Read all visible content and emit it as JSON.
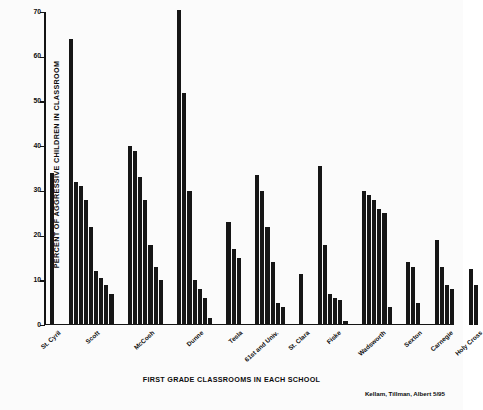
{
  "chart_data": {
    "type": "bar",
    "title": "",
    "xlabel": "FIRST GRADE CLASSROOMS IN EACH SCHOOL",
    "ylabel": "PERCENT OF AGGRESSIVE CHILDREN IN CLASSROOM",
    "ylim": [
      0,
      70
    ],
    "ytick_labels": [
      "0",
      "10",
      "20",
      "30",
      "40",
      "50",
      "60",
      "70"
    ],
    "ytick_values": [
      0,
      10,
      20,
      30,
      40,
      50,
      60,
      70
    ],
    "grid": false,
    "legend": "none",
    "bar_color": "#161616",
    "axis_color": "#141414",
    "credit": "Kellam, Tillman, Albert 5/95",
    "categories": [
      "St. Cyril",
      "Scott",
      "McCosh",
      "Dunne",
      "Tesla",
      "61st and Univ.",
      "St. Clara",
      "Fiske",
      "Wadsworth",
      "Sexton",
      "Carnegie",
      "Holy Cross"
    ],
    "groups": [
      {
        "name": "St. Cyril",
        "values": [
          34
        ]
      },
      {
        "name": "Scott",
        "values": [
          64,
          32,
          31,
          28,
          22,
          12,
          10.5,
          9,
          7
        ]
      },
      {
        "name": "McCosh",
        "values": [
          40,
          39,
          33,
          28,
          18,
          13,
          10
        ]
      },
      {
        "name": "Dunne",
        "values": [
          70.5,
          52,
          30,
          10,
          8,
          6,
          1.5
        ]
      },
      {
        "name": "Tesla",
        "values": [
          23,
          17,
          15
        ]
      },
      {
        "name": "61st and Univ.",
        "values": [
          33.5,
          30,
          22,
          14,
          5,
          4
        ]
      },
      {
        "name": "St. Clara",
        "values": [
          11.5
        ]
      },
      {
        "name": "Fiske",
        "values": [
          35.5,
          18,
          7,
          6,
          5.5,
          1
        ]
      },
      {
        "name": "Wadsworth",
        "values": [
          30,
          29,
          28,
          26,
          25,
          4
        ]
      },
      {
        "name": "Sexton",
        "values": [
          14,
          13,
          5
        ]
      },
      {
        "name": "Carnegie",
        "values": [
          19,
          13,
          9,
          8
        ]
      },
      {
        "name": "Holy Cross",
        "values": [
          12.5,
          9
        ]
      }
    ]
  }
}
